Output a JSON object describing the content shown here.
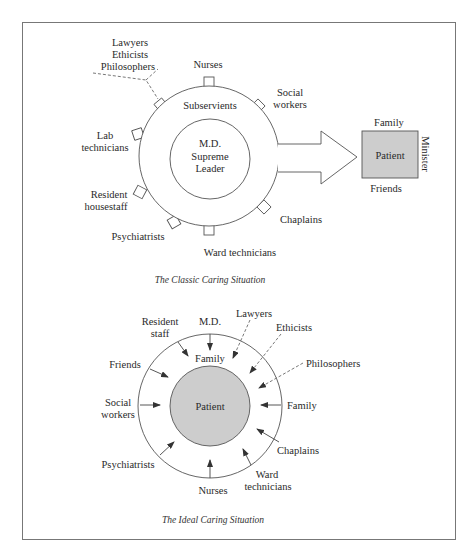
{
  "classic": {
    "caption": "The Classic Caring Situation",
    "center_line1": "M.D.",
    "center_line2": "Supreme",
    "center_line3": "Leader",
    "ring_label": "Subservients",
    "outer_groups": {
      "dashed_group_line1": "Lawyers",
      "dashed_group_line2": "Ethicists",
      "dashed_group_line3": "Philosophers",
      "nurses": "Nurses",
      "social_line1": "Social",
      "social_line2": "workers",
      "lab_line1": "Lab",
      "lab_line2": "technicians",
      "resident_line1": "Resident",
      "resident_line2": "housestaff",
      "psychiatrists": "Psychiatrists",
      "ward": "Ward technicians",
      "chaplains": "Chaplains"
    },
    "patient_box": {
      "label": "Patient",
      "top": "Family",
      "bottom": "Friends",
      "side": "Minister"
    },
    "colors": {
      "patient_fill": "#cdcdcd",
      "stroke": "#555555"
    }
  },
  "ideal": {
    "caption": "The Ideal Caring Situation",
    "center": "Patient",
    "inner_label": "Family",
    "outer": {
      "resident_line1": "Resident",
      "resident_line2": "staff",
      "md": "M.D.",
      "lawyers": "Lawyers",
      "ethicists": "Ethicists",
      "philosophers": "Philosophers",
      "friends": "Friends",
      "social_line1": "Social",
      "social_line2": "workers",
      "family": "Family",
      "psychiatrists": "Psychiatrists",
      "chaplains": "Chaplains",
      "nurses": "Nurses",
      "ward_line1": "Ward",
      "ward_line2": "technicians"
    },
    "colors": {
      "patient_fill": "#cdcdcd",
      "stroke": "#555555"
    }
  }
}
